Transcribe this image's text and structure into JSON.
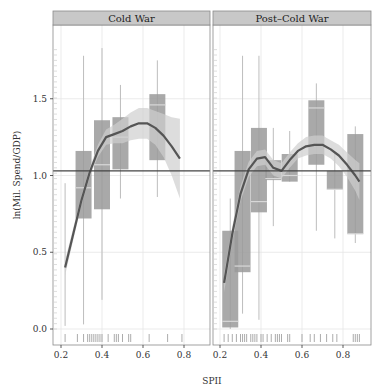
{
  "chart_data": {
    "type": "box",
    "xlabel": "SPII",
    "ylabel": "ln(Mil. Spend/GDP)",
    "ylim": [
      -0.1,
      1.95
    ],
    "xlim": [
      0.17,
      0.93
    ],
    "yticks": [
      0.0,
      0.5,
      1.0,
      1.5
    ],
    "ytick_labels": [
      "0.0",
      "0.5",
      "1.0",
      "1.5"
    ],
    "xticks": [
      0.2,
      0.4,
      0.6,
      0.8
    ],
    "xtick_labels": [
      "0.2",
      "0.4",
      "0.6",
      "0.8"
    ],
    "reference_line": 1.03,
    "grid": true,
    "colors": {
      "strip": "#c8c8c8",
      "box": "#9a9a9a",
      "whisker": "#bdbdbd",
      "ribbon": "#cfcfcf",
      "fit": "#555555",
      "refline": "#444444",
      "rug": "#888888",
      "grid": "#e6e6e6"
    },
    "panels": [
      {
        "title": "Cold War",
        "boxes": [
          {
            "x": 0.22,
            "lo": 0.02,
            "q1": 0.0,
            "med": 0.0,
            "q3": 0.0,
            "hi": 0.95
          },
          {
            "x": 0.31,
            "lo": 0.03,
            "q1": 0.72,
            "med": 0.92,
            "q3": 1.16,
            "hi": 1.78
          },
          {
            "x": 0.4,
            "lo": 0.19,
            "q1": 0.78,
            "med": 1.07,
            "q3": 1.36,
            "hi": 1.83
          },
          {
            "x": 0.49,
            "lo": 0.85,
            "q1": 1.04,
            "med": 1.25,
            "q3": 1.38,
            "hi": 1.59
          },
          {
            "x": 0.67,
            "lo": 0.86,
            "q1": 1.1,
            "med": 1.46,
            "q3": 1.53,
            "hi": 1.75
          }
        ],
        "fit": {
          "x": [
            0.22,
            0.26,
            0.3,
            0.34,
            0.38,
            0.42,
            0.46,
            0.5,
            0.54,
            0.58,
            0.62,
            0.66,
            0.7,
            0.74,
            0.78
          ],
          "y": [
            0.4,
            0.62,
            0.84,
            1.02,
            1.16,
            1.25,
            1.27,
            1.29,
            1.32,
            1.34,
            1.34,
            1.31,
            1.26,
            1.19,
            1.11
          ]
        },
        "ribbon_halfwidth": [
          0.05,
          0.04,
          0.03,
          0.03,
          0.04,
          0.05,
          0.06,
          0.08,
          0.09,
          0.1,
          0.1,
          0.11,
          0.14,
          0.19,
          0.26
        ],
        "rug": [
          0.22,
          0.28,
          0.31,
          0.33,
          0.34,
          0.35,
          0.36,
          0.37,
          0.38,
          0.39,
          0.4,
          0.43,
          0.46,
          0.47,
          0.48,
          0.5,
          0.53,
          0.54,
          0.63,
          0.72,
          0.79
        ]
      },
      {
        "title": "Post–Cold War",
        "boxes": [
          {
            "x": 0.25,
            "lo": 0.0,
            "q1": 0.01,
            "med": 0.05,
            "q3": 0.64,
            "hi": 0.85
          },
          {
            "x": 0.31,
            "lo": 0.1,
            "q1": 0.37,
            "med": 0.41,
            "q3": 1.16,
            "hi": 1.78
          },
          {
            "x": 0.39,
            "lo": 0.06,
            "q1": 0.76,
            "med": 0.83,
            "q3": 1.31,
            "hi": 1.78
          },
          {
            "x": 0.46,
            "lo": 0.67,
            "q1": 0.97,
            "med": 0.98,
            "q3": 1.1,
            "hi": 1.31
          },
          {
            "x": 0.54,
            "lo": 0.96,
            "q1": 0.96,
            "med": 1.0,
            "q3": 1.14,
            "hi": 1.29
          },
          {
            "x": 0.67,
            "lo": 0.64,
            "q1": 1.07,
            "med": 1.44,
            "q3": 1.49,
            "hi": 1.6
          },
          {
            "x": 0.76,
            "lo": 0.59,
            "q1": 0.91,
            "med": 0.91,
            "q3": 1.03,
            "hi": 1.16
          },
          {
            "x": 0.86,
            "lo": 0.56,
            "q1": 0.62,
            "med": 0.62,
            "q3": 1.27,
            "hi": 1.32
          }
        ],
        "fit": {
          "x": [
            0.22,
            0.26,
            0.3,
            0.34,
            0.38,
            0.42,
            0.46,
            0.5,
            0.54,
            0.58,
            0.62,
            0.66,
            0.7,
            0.74,
            0.78,
            0.82,
            0.86,
            0.88
          ],
          "y": [
            0.3,
            0.62,
            0.88,
            1.04,
            1.11,
            1.12,
            1.05,
            1.03,
            1.1,
            1.16,
            1.19,
            1.2,
            1.2,
            1.17,
            1.13,
            1.07,
            1.0,
            0.96
          ]
        },
        "ribbon_halfwidth": [
          0.06,
          0.05,
          0.05,
          0.05,
          0.05,
          0.05,
          0.05,
          0.05,
          0.05,
          0.05,
          0.06,
          0.06,
          0.06,
          0.06,
          0.07,
          0.08,
          0.1,
          0.12
        ],
        "rug": [
          0.22,
          0.24,
          0.26,
          0.28,
          0.3,
          0.31,
          0.32,
          0.33,
          0.35,
          0.36,
          0.37,
          0.38,
          0.4,
          0.41,
          0.43,
          0.45,
          0.47,
          0.48,
          0.49,
          0.5,
          0.53,
          0.54,
          0.6,
          0.64,
          0.66,
          0.69,
          0.72,
          0.75,
          0.77,
          0.85,
          0.86,
          0.87,
          0.88
        ]
      }
    ]
  }
}
